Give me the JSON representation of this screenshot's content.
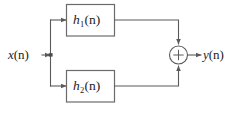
{
  "diagram": {
    "kind": "signal-flow-block-diagram",
    "background_color": "#ffffff",
    "line_color": "#5a5a5a",
    "text_color": "#1d1d1d",
    "input": {
      "name": "input-signal",
      "label_base": "x",
      "label_arg": "(n)",
      "label_full": "x(n)"
    },
    "output": {
      "name": "output-signal",
      "label_base": "y",
      "label_arg": "(n)",
      "label_full": "y(n)"
    },
    "blocks": [
      {
        "id": "h1",
        "label_base": "h",
        "label_sub": "1",
        "label_arg": "(n)",
        "label_full": "h1(n)",
        "position": "top"
      },
      {
        "id": "h2",
        "label_base": "h",
        "label_sub": "2",
        "label_arg": "(n)",
        "label_full": "h2(n)",
        "position": "bottom"
      }
    ],
    "adder": {
      "name": "summing-junction",
      "operator": "+",
      "inputs": 2
    },
    "nodes": [
      {
        "id": "split",
        "label": "branch-point"
      }
    ]
  }
}
